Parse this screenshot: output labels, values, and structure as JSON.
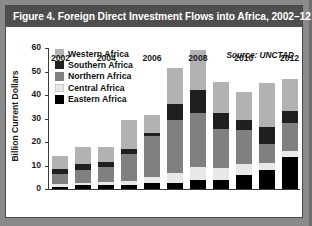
{
  "figure": {
    "title": "Figure 4. Foreign Direct Investment Flows into Africa, 2002–12",
    "source_note": "Source: UNCTAD"
  },
  "colors": {
    "title_bar": "#4e4e4e",
    "title_text": "#ffffff",
    "frame": "#8a8a8a",
    "card": "#ffffff",
    "axis": "#3a3a3a",
    "western_africa": "#b2b2b2",
    "southern_africa": "#1f1f1f",
    "northern_africa": "#808080",
    "central_africa": "#e8e8e8",
    "eastern_africa": "#000000"
  },
  "legend": {
    "position": "top-left-inside",
    "items": [
      {
        "label": "Western Africa",
        "color": "#b2b2b2",
        "swatch_name": "legend-swatch-western-africa"
      },
      {
        "label": "Southern Africa",
        "color": "#1f1f1f",
        "swatch_name": "legend-swatch-southern-africa"
      },
      {
        "label": "Northern Africa",
        "color": "#808080",
        "swatch_name": "legend-swatch-northern-africa"
      },
      {
        "label": "Central Africa",
        "color": "#e8e8e8",
        "swatch_name": "legend-swatch-central-africa"
      },
      {
        "label": "Eastern Africa",
        "color": "#000000",
        "swatch_name": "legend-swatch-eastern-africa"
      }
    ]
  },
  "yaxis": {
    "label": "Billion Current Dollars",
    "ticks": [
      0,
      10,
      20,
      30,
      40,
      50,
      60
    ],
    "tick_labels": [
      "0",
      "10",
      "20",
      "30",
      "40",
      "50",
      "60"
    ],
    "min": 0,
    "max": 60
  },
  "xaxis": {
    "tick_labels": [
      "2002",
      "2004",
      "2006",
      "2008",
      "2010",
      "2012"
    ],
    "labeled_years": [
      2002,
      2004,
      2006,
      2008,
      2010,
      2012
    ]
  },
  "chart_data": {
    "type": "bar",
    "subtype": "stacked-vertical",
    "title": "Figure 4. Foreign Direct Investment Flows into Africa, 2002–12",
    "subtitle": "",
    "xlabel": "",
    "ylabel": "Billion Current Dollars",
    "ylim": [
      0,
      60
    ],
    "yticks": [
      0,
      10,
      20,
      30,
      40,
      50,
      60
    ],
    "grid": false,
    "legend_position": "top-left-inside",
    "annotations": [
      "Source: UNCTAD"
    ],
    "categories": [
      "2002",
      "2003",
      "2004",
      "2005",
      "2006",
      "2007",
      "2008",
      "2009",
      "2010",
      "2011",
      "2012"
    ],
    "tick_labels_shown": [
      "2002",
      "",
      "2004",
      "",
      "2006",
      "",
      "2008",
      "",
      "2010",
      "",
      "2012"
    ],
    "stack_order_bottom_to_top": [
      "Eastern Africa",
      "Central Africa",
      "Northern Africa",
      "Southern Africa",
      "Western Africa"
    ],
    "series": [
      {
        "name": "Eastern Africa",
        "color": "#000000",
        "values": [
          1.0,
          1.5,
          1.5,
          1.5,
          2.5,
          2.5,
          4.0,
          4.0,
          6.0,
          8.0,
          13.5
        ]
      },
      {
        "name": "Central Africa",
        "color": "#e8e8e8",
        "values": [
          1.0,
          1.0,
          1.5,
          2.0,
          2.5,
          4.5,
          5.5,
          5.0,
          4.5,
          3.0,
          2.5
        ]
      },
      {
        "name": "Northern Africa",
        "color": "#808080",
        "values": [
          4.5,
          5.5,
          6.5,
          11.5,
          17.5,
          22.5,
          23.0,
          16.5,
          14.5,
          8.0,
          12.0
        ]
      },
      {
        "name": "Southern Africa",
        "color": "#1f1f1f",
        "values": [
          2.0,
          2.5,
          2.0,
          2.0,
          1.5,
          6.5,
          9.5,
          7.0,
          4.5,
          7.5,
          5.0
        ]
      },
      {
        "name": "Western Africa",
        "color": "#b2b2b2",
        "values": [
          5.5,
          7.5,
          6.5,
          12.5,
          7.5,
          15.5,
          17.0,
          13.0,
          12.0,
          18.5,
          14.0
        ]
      }
    ],
    "totals": [
      14.0,
      18.0,
      18.0,
      29.5,
      31.5,
      51.5,
      59.0,
      45.5,
      41.5,
      45.0,
      47.0
    ]
  }
}
